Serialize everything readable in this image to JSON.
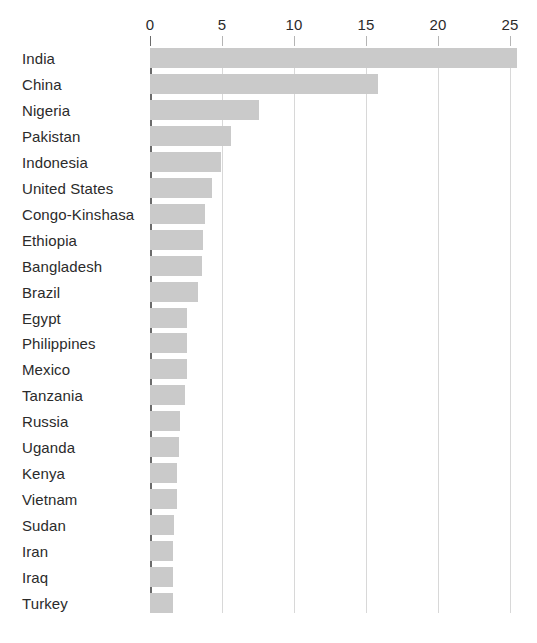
{
  "chart_data": {
    "type": "bar",
    "orientation": "horizontal",
    "title": "",
    "subtitle": "",
    "xlabel": "",
    "ylabel": "",
    "xlim": [
      0,
      26.5
    ],
    "grid": true,
    "grid_axis": "x",
    "legend": false,
    "legend_position": "none",
    "xticks": [
      0,
      5,
      10,
      15,
      20,
      25
    ],
    "xtick_labels": [
      "0",
      "5",
      "10",
      "15",
      "20",
      "25"
    ],
    "categories": [
      "India",
      "China",
      "Nigeria",
      "Pakistan",
      "Indonesia",
      "United States",
      "Congo-Kinshasa",
      "Ethiopia",
      "Bangladesh",
      "Brazil",
      "Egypt",
      "Philippines",
      "Mexico",
      "Tanzania",
      "Russia",
      "Uganda",
      "Kenya",
      "Vietnam",
      "Sudan",
      "Iran",
      "Iraq",
      "Turkey"
    ],
    "values": [
      25.5,
      15.8,
      7.6,
      5.6,
      4.9,
      4.3,
      3.8,
      3.7,
      3.6,
      3.3,
      2.6,
      2.6,
      2.6,
      2.4,
      2.1,
      2.0,
      1.9,
      1.9,
      1.7,
      1.6,
      1.6,
      1.6
    ],
    "bar_color": "#cacaca",
    "axis_color": "#6b6b6b",
    "grid_color": "#d8d8d8",
    "text_color": "#2b2b2b"
  }
}
